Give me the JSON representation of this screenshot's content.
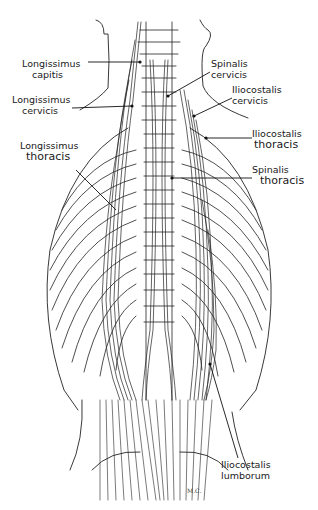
{
  "diagram": {
    "labels": [
      {
        "id": "longissimus-capitis",
        "line1": "Longissimus",
        "line2": "capitis",
        "side": "left",
        "x": 22,
        "y": 58
      },
      {
        "id": "longissimus-cervicis",
        "line1": "Longissimus",
        "line2": "cervicis",
        "side": "left",
        "x": 12,
        "y": 94
      },
      {
        "id": "longissimus-thoracis",
        "line1": "Longissimus",
        "line2": "thoracis",
        "side": "left",
        "x": 20,
        "y": 140
      },
      {
        "id": "spinalis-cervicis",
        "line1": "Spinalis",
        "line2": "cervicis",
        "side": "right",
        "x": 211,
        "y": 58
      },
      {
        "id": "iliocostalis-cervicis",
        "line1": "Iliocostalis",
        "line2": "cervicis",
        "side": "right",
        "x": 232,
        "y": 84
      },
      {
        "id": "iliocostalis-thoracis",
        "line1": "Iliocostalis",
        "line2": "thoracis",
        "side": "right",
        "x": 252,
        "y": 130
      },
      {
        "id": "spinalis-thoracis",
        "line1": "Spinalis",
        "line2": "thoracis",
        "side": "right",
        "x": 252,
        "y": 164
      },
      {
        "id": "iliocostalis-lumborum",
        "line1": "Iliocostalis",
        "line2": "lumborum",
        "side": "right",
        "x": 221,
        "y": 459
      }
    ],
    "signature": "M.C."
  }
}
